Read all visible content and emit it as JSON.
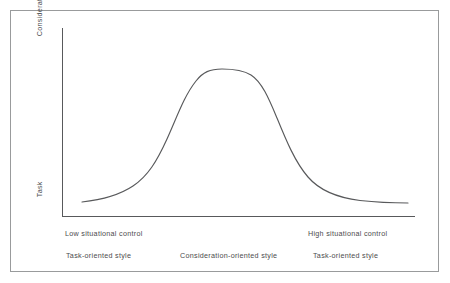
{
  "figure": {
    "frame_color": "#999b9c",
    "background": "#ffffff",
    "axis_color": "#58595b",
    "curve_color": "#58595b",
    "text_color": "#4c4c4e"
  },
  "axes": {
    "y_top_label": "Consideration",
    "y_bottom_label": "Task",
    "x_left_label": "Low situational control",
    "x_right_label": "High situational control"
  },
  "style_captions": {
    "left": "Task-oriented style",
    "center": "Consideration-oriented style",
    "right": "Task-oriented style"
  },
  "chart_data": {
    "type": "line",
    "title": "",
    "subtitle": "",
    "xlabel": "Situational control",
    "ylabel": "Leadership orientation",
    "grid": false,
    "legend": false,
    "legend_position": "none",
    "xlim": [
      0,
      100
    ],
    "ylim": [
      0,
      100
    ],
    "x_tick_labels": [
      "Low situational control",
      "High situational control"
    ],
    "y_tick_labels": [
      "Task",
      "Consideration"
    ],
    "annotations": [
      "Task-oriented style",
      "Consideration-oriented style",
      "Task-oriented style"
    ],
    "series": [
      {
        "name": "Leader effectiveness orientation",
        "x": [
          6,
          12,
          18,
          24,
          30,
          36,
          41,
          46,
          50,
          55,
          60,
          65,
          70,
          75,
          80,
          86,
          92,
          98
        ],
        "values": [
          8,
          9,
          11,
          15,
          22,
          36,
          56,
          75,
          87,
          91,
          90,
          84,
          70,
          52,
          35,
          21,
          13,
          8
        ]
      }
    ],
    "curve_path": "M 82 202 C 100 200 118 196 133 186 C 148 176 157 161 167 139 C 177 117 184 96 196 81 C 203 72 210 69 222 69 C 234 69 243 70 251 75 C 262 82 269 99 277 118 C 286 140 295 162 308 177 C 320 191 340 198 360 200.5 C 378 202.5 395 203 408 203"
  }
}
